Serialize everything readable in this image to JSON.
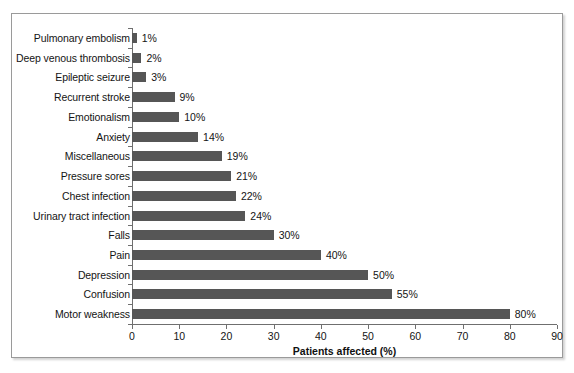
{
  "chart_data": {
    "type": "bar",
    "orientation": "horizontal",
    "title": "",
    "xlabel": "Patients affected (%)",
    "ylabel": "",
    "xlim": [
      0,
      90
    ],
    "xticks": [
      0,
      10,
      20,
      30,
      40,
      50,
      60,
      70,
      80,
      90
    ],
    "grid": false,
    "legend": null,
    "bar_color": "#565656",
    "categories": [
      "Pulmonary embolism",
      "Deep venous thrombosis",
      "Epileptic seizure",
      "Recurrent stroke",
      "Emotionalism",
      "Anxiety",
      "Miscellaneous",
      "Pressure sores",
      "Chest infection",
      "Urinary tract infection",
      "Falls",
      "Pain",
      "Depression",
      "Confusion",
      "Motor weakness"
    ],
    "values": [
      1,
      2,
      3,
      9,
      10,
      14,
      19,
      21,
      22,
      24,
      30,
      40,
      50,
      55,
      80
    ],
    "data_labels": [
      "1%",
      "2%",
      "3%",
      "9%",
      "10%",
      "14%",
      "19%",
      "21%",
      "22%",
      "24%",
      "30%",
      "40%",
      "50%",
      "55%",
      "80%"
    ]
  }
}
